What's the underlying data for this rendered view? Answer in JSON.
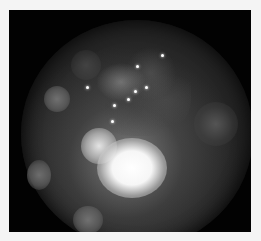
{
  "image": {
    "description": "Grayscale circular endoscopic/microscope view with bokeh highlights and a bright central glare",
    "colors": {
      "background": "#f4f4f4",
      "frame": "#020202",
      "glare": "#ffffff"
    }
  }
}
